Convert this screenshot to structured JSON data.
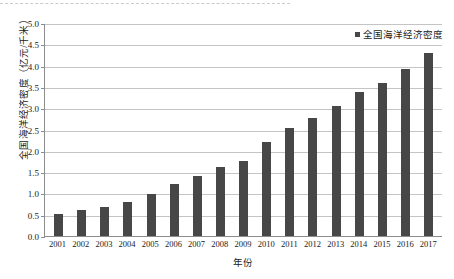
{
  "chart_data": {
    "type": "bar",
    "title": "",
    "subtitle": "",
    "xlabel": "年份",
    "ylabel": "全国海洋经济密度（亿元/千米）",
    "categories": [
      "2001",
      "2002",
      "2003",
      "2004",
      "2005",
      "2006",
      "2007",
      "2008",
      "2009",
      "2010",
      "2011",
      "2012",
      "2013",
      "2014",
      "2015",
      "2016",
      "2017"
    ],
    "series": [
      {
        "name": "全国海洋经济密度",
        "values": [
          0.52,
          0.62,
          0.67,
          0.81,
          0.98,
          1.21,
          1.42,
          1.62,
          1.77,
          2.21,
          2.54,
          2.78,
          3.05,
          3.38,
          3.6,
          3.92,
          4.3
        ],
        "color": "#474747"
      }
    ],
    "ylim": [
      0.0,
      5.0
    ],
    "ytick_values": [
      0.0,
      0.5,
      1.0,
      1.5,
      2.0,
      2.5,
      3.0,
      3.5,
      4.0,
      4.5,
      5.0
    ],
    "ytick_labels": [
      "0.0",
      "0.5",
      "1.0",
      "1.5",
      "2.0",
      "2.5",
      "3.0",
      "3.5",
      "4.0",
      "4.5",
      "5.0"
    ],
    "grid": true,
    "grid_axis": "y",
    "legend": {
      "position": "top-right",
      "entries": [
        "全国海洋经济密度"
      ]
    },
    "colors": {
      "bar": "#474747",
      "gridline": "#c4c4c4",
      "axis": "#8d8d8d",
      "text": "#1a1a1a",
      "background": "#ffffff"
    }
  }
}
